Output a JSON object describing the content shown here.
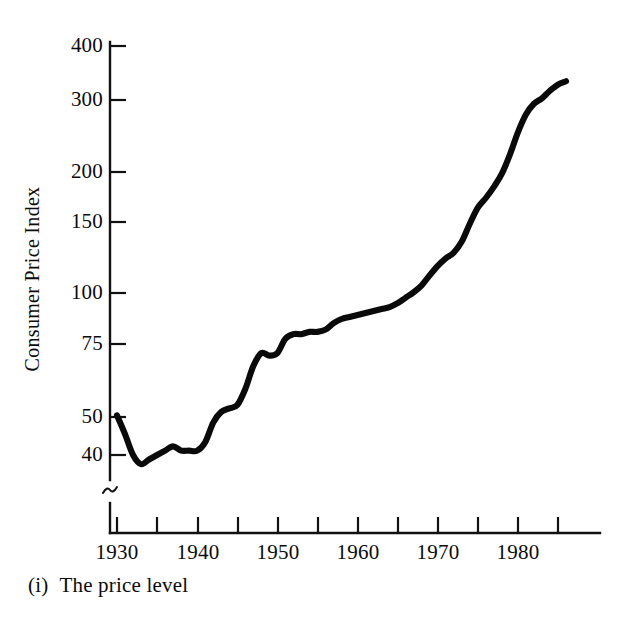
{
  "figure": {
    "caption_index": "(i)",
    "caption_text": "The price level",
    "ink_color": "#0a0a0a",
    "background_color": "#ffffff"
  },
  "axes": {
    "y_axis_title": "Consumer Price Index",
    "y_tick_labels": [
      "400",
      "300",
      "200",
      "150",
      "100",
      "75",
      "50",
      "40"
    ],
    "x_tick_labels": [
      "1930",
      "1940",
      "1950",
      "1960",
      "1970",
      "1980"
    ],
    "axis_break_symbol": "scale-break-squiggle"
  },
  "chart_data": {
    "type": "line",
    "title": "The price level",
    "xlabel": "",
    "ylabel": "Consumer Price Index",
    "scale": "log",
    "grid": false,
    "legend": null,
    "axis_break": {
      "axis": "y",
      "below_value": 40,
      "note": "y-axis is broken below 40; origin is not zero"
    },
    "yticks": [
      400,
      300,
      200,
      150,
      100,
      75,
      50,
      40
    ],
    "ylim": [
      36,
      420
    ],
    "xticks": [
      1930,
      1935,
      1940,
      1945,
      1950,
      1955,
      1960,
      1965,
      1970,
      1975,
      1980,
      1985
    ],
    "xtick_labels_shown": [
      1930,
      1940,
      1950,
      1960,
      1970,
      1980
    ],
    "xlim": [
      1928,
      1988
    ],
    "series": [
      {
        "name": "Consumer Price Index",
        "x": [
          1930,
          1931,
          1932,
          1933,
          1934,
          1935,
          1936,
          1937,
          1938,
          1939,
          1940,
          1941,
          1942,
          1943,
          1944,
          1945,
          1946,
          1947,
          1948,
          1949,
          1950,
          1951,
          1952,
          1953,
          1954,
          1955,
          1956,
          1957,
          1958,
          1959,
          1960,
          1961,
          1962,
          1963,
          1964,
          1965,
          1966,
          1967,
          1968,
          1969,
          1970,
          1971,
          1972,
          1973,
          1974,
          1975,
          1976,
          1977,
          1978,
          1979,
          1980,
          1981,
          1982,
          1983,
          1984,
          1985,
          1986
        ],
        "values": [
          50,
          45,
          40,
          38,
          39,
          40,
          41,
          42,
          41,
          41,
          41,
          43,
          48,
          51,
          52,
          53,
          58,
          66,
          71,
          70,
          71,
          77,
          79,
          79,
          80,
          80,
          81,
          84,
          86,
          87,
          88,
          89,
          90,
          91,
          92,
          94,
          97,
          100,
          104,
          110,
          116,
          121,
          125,
          133,
          147,
          161,
          170,
          181,
          195,
          217,
          246,
          272,
          289,
          298,
          311,
          322,
          328
        ]
      }
    ]
  },
  "tick_geometry": {
    "note": "pixel positions used by the template renderer",
    "y": [
      {
        "label": "400",
        "py": 46
      },
      {
        "label": "300",
        "py": 100
      },
      {
        "label": "200",
        "py": 172
      },
      {
        "label": "150",
        "py": 222
      },
      {
        "label": "100",
        "py": 293
      },
      {
        "label": "75",
        "py": 344
      },
      {
        "label": "50",
        "py": 417
      },
      {
        "label": "40",
        "py": 455
      }
    ],
    "x": [
      {
        "label": "1930",
        "px": 117,
        "major": true
      },
      {
        "label": "",
        "px": 157,
        "major": false
      },
      {
        "label": "1940",
        "px": 198,
        "major": true
      },
      {
        "label": "",
        "px": 238,
        "major": false
      },
      {
        "label": "1950",
        "px": 278,
        "major": true
      },
      {
        "label": "",
        "px": 318,
        "major": false
      },
      {
        "label": "1960",
        "px": 358,
        "major": true
      },
      {
        "label": "",
        "px": 398,
        "major": false
      },
      {
        "label": "1970",
        "px": 438,
        "major": true
      },
      {
        "label": "",
        "px": 478,
        "major": false
      },
      {
        "label": "1980",
        "px": 518,
        "major": true
      },
      {
        "label": "",
        "px": 558,
        "major": false
      }
    ]
  }
}
